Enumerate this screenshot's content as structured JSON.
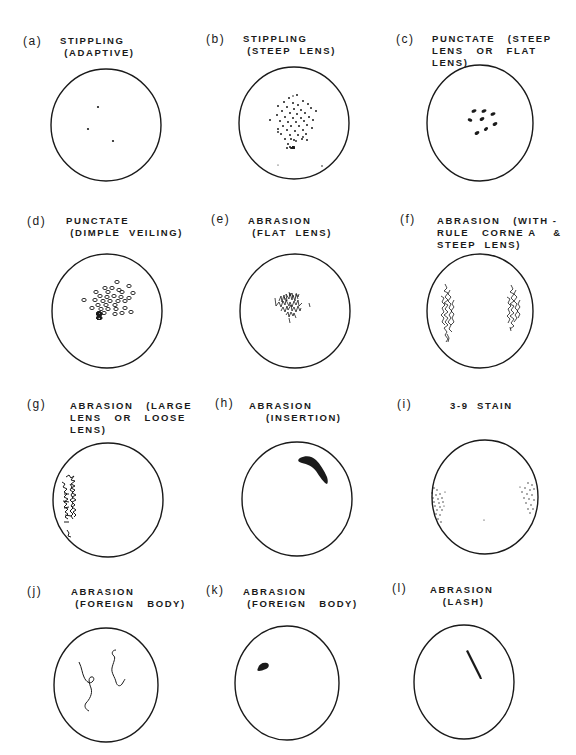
{
  "figure": {
    "panels": [
      {
        "letter": "(a)",
        "title_lines": [
          "STIPPLING",
          " (ADAPTIVE)"
        ],
        "finding": "stippling",
        "cause": "adaptive",
        "cx": 106,
        "cy": 125,
        "r": 55
      },
      {
        "letter": "(b)",
        "title_lines": [
          "STIPPLING",
          " (STEEP  LENS)"
        ],
        "finding": "stippling",
        "cause": "steep lens",
        "cx": 294,
        "cy": 123,
        "r": 55
      },
      {
        "letter": "(c)",
        "title_lines": [
          "PUNCTATE   (STEEP",
          "LENS   OR   FLAT",
          "LENS)"
        ],
        "finding": "punctate",
        "cause": "steep lens or flat lens",
        "cx": 480,
        "cy": 123,
        "r": 53
      },
      {
        "letter": "(d)",
        "title_lines": [
          "PUNCTATE",
          " (DIMPLE  VEILING)"
        ],
        "finding": "punctate",
        "cause": "dimple veiling",
        "cx": 107,
        "cy": 310,
        "r": 55
      },
      {
        "letter": "(e)",
        "title_lines": [
          "ABRASION",
          " (FLAT  LENS)"
        ],
        "finding": "abrasion",
        "cause": "flat lens",
        "cx": 295,
        "cy": 311,
        "r": 55
      },
      {
        "letter": "(f)",
        "title_lines": [
          "ABRASION   (WITH -",
          "RULE   CORNE A    &",
          "STEEP  LENS)"
        ],
        "finding": "abrasion",
        "cause": "with-rule cornea & steep lens",
        "cx": 479,
        "cy": 311,
        "r": 53
      },
      {
        "letter": "(g)",
        "title_lines": [
          "ABRASION   (LARGE",
          "LENS   OR   LOOSE",
          "LENS)"
        ],
        "finding": "abrasion",
        "cause": "large lens or loose lens",
        "cx": 108,
        "cy": 500,
        "r": 55
      },
      {
        "letter": "(h)",
        "title_lines": [
          "ABRASION",
          "    (INSERTION)"
        ],
        "finding": "abrasion",
        "cause": "insertion",
        "cx": 297,
        "cy": 499,
        "r": 55
      },
      {
        "letter": "(i)",
        "title_lines": [
          "3-9  STAIN"
        ],
        "finding": "3-9 stain",
        "cause": "",
        "cx": 485,
        "cy": 497,
        "r": 53
      },
      {
        "letter": "(j)",
        "title_lines": [
          "ABRASION",
          " (FOREIGN   BODY)"
        ],
        "finding": "abrasion",
        "cause": "foreign body",
        "cx": 106,
        "cy": 685,
        "r": 52
      },
      {
        "letter": "(k)",
        "title_lines": [
          "ABRASION",
          " (FOREIGN   BODY)"
        ],
        "finding": "abrasion",
        "cause": "foreign body",
        "cx": 287,
        "cy": 684,
        "r": 52
      },
      {
        "letter": "(l)",
        "title_lines": [
          "ABRASION",
          "   (LASH)"
        ],
        "finding": "abrasion",
        "cause": "lash",
        "cx": 464,
        "cy": 682,
        "r": 50
      }
    ]
  },
  "labels": {
    "a": {
      "letter": "(a)",
      "l1": "STIPPLING",
      "l2": " (ADAPTIVE)"
    },
    "b": {
      "letter": "(b)",
      "l1": "STIPPLING",
      "l2": " (STEEP  LENS)"
    },
    "c": {
      "letter": "(c)",
      "l1": "PUNCTATE   (STEEP",
      "l2": "LENS   OR   FLAT",
      "l3": "LENS)"
    },
    "d": {
      "letter": "(d)",
      "l1": "PUNCTATE",
      "l2": " (DIMPLE  VEILING)"
    },
    "e": {
      "letter": "(e)",
      "l1": "ABRASION",
      "l2": " (FLAT  LENS)"
    },
    "f": {
      "letter": "(f)",
      "l1": "ABRASION   (WITH -",
      "l2": "RULE   CORNE A    &",
      "l3": "STEEP  LENS)"
    },
    "g": {
      "letter": "(g)",
      "l1": "ABRASION   (LARGE",
      "l2": "LENS   OR   LOOSE",
      "l3": "LENS)"
    },
    "h": {
      "letter": "(h)",
      "l1": "ABRASION",
      "l2": "    (INSERTION)"
    },
    "i": {
      "letter": "(i)",
      "l1": "3-9  STAIN"
    },
    "j": {
      "letter": "(j)",
      "l1": "ABRASION",
      "l2": " (FOREIGN   BODY)"
    },
    "k": {
      "letter": "(k)",
      "l1": "ABRASION",
      "l2": " (FOREIGN   BODY)"
    },
    "l": {
      "letter": "(l)",
      "l1": "ABRASION",
      "l2": "   (LASH)"
    }
  },
  "colors": {
    "ink": "#1a1a1a",
    "background": "#ffffff"
  }
}
